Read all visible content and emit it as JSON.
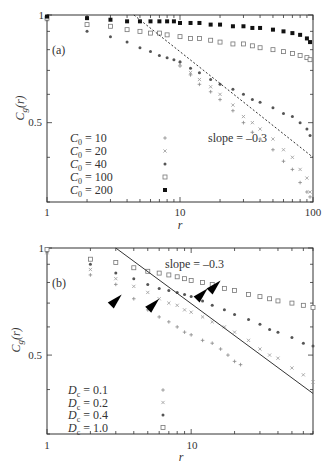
{
  "chart_data": [
    {
      "panel": "(a)",
      "type": "scatter",
      "scale": "log-log",
      "xlabel": "r",
      "ylabel": "C_g(r)",
      "xlim": [
        1,
        100
      ],
      "ylim": [
        0.3,
        1
      ],
      "xticks": [
        "1",
        "10",
        "100"
      ],
      "yticks": [
        "0.5",
        "1"
      ],
      "annotation": "slope = -0.3",
      "reference_line": {
        "slope": -0.3,
        "points": [
          [
            4.5,
            1.0
          ],
          [
            100,
            0.4
          ]
        ]
      },
      "legend_position": "lower-left",
      "series": [
        {
          "name": "C0 = 10",
          "label_sub": "0",
          "label_val": "10",
          "marker": "+",
          "x": [
            1,
            10,
            12,
            14,
            17,
            20,
            25,
            30,
            35,
            40,
            50,
            60,
            70,
            80,
            90,
            95
          ],
          "y": [
            0.97,
            0.72,
            0.68,
            0.64,
            0.61,
            0.58,
            0.54,
            0.5,
            0.47,
            0.45,
            0.42,
            0.39,
            0.37,
            0.34,
            0.32,
            0.31
          ]
        },
        {
          "name": "C0 = 20",
          "label_sub": "0",
          "label_val": "20",
          "marker": "x",
          "x": [
            1,
            10,
            12,
            14,
            17,
            20,
            25,
            30,
            35,
            40,
            50,
            60,
            70,
            80,
            90,
            95
          ],
          "y": [
            0.97,
            0.73,
            0.69,
            0.66,
            0.63,
            0.6,
            0.56,
            0.52,
            0.5,
            0.48,
            0.45,
            0.42,
            0.4,
            0.37,
            0.35,
            0.32
          ]
        },
        {
          "name": "C0 = 40",
          "label_sub": "0",
          "label_val": "40",
          "marker": "*",
          "x": [
            1,
            2,
            3,
            4,
            5,
            6,
            7,
            8,
            9,
            10,
            12,
            14,
            17,
            20,
            25,
            30,
            35,
            40,
            50,
            60,
            70,
            80,
            90,
            95
          ],
          "y": [
            0.97,
            0.9,
            0.87,
            0.84,
            0.81,
            0.79,
            0.77,
            0.76,
            0.75,
            0.74,
            0.71,
            0.69,
            0.66,
            0.64,
            0.62,
            0.6,
            0.58,
            0.57,
            0.55,
            0.53,
            0.52,
            0.5,
            0.48,
            0.46
          ]
        },
        {
          "name": "C0 = 100",
          "label_sub": "0",
          "label_val": "100",
          "marker": "square-open",
          "x": [
            1,
            2,
            3,
            4,
            5,
            6,
            7,
            8,
            10,
            12,
            14,
            17,
            20,
            25,
            30,
            35,
            40,
            50,
            60,
            70,
            80,
            90,
            95
          ],
          "y": [
            0.98,
            0.94,
            0.93,
            0.91,
            0.9,
            0.89,
            0.89,
            0.88,
            0.87,
            0.86,
            0.86,
            0.85,
            0.84,
            0.83,
            0.83,
            0.82,
            0.81,
            0.8,
            0.79,
            0.78,
            0.77,
            0.76,
            0.75
          ]
        },
        {
          "name": "C0 = 200",
          "label_sub": "0",
          "label_val": "200",
          "marker": "square-filled",
          "x": [
            1,
            2,
            3,
            4,
            5,
            6,
            7,
            8,
            9,
            10,
            12,
            14,
            17,
            20,
            25,
            30,
            35,
            40,
            50,
            60,
            70,
            80,
            90,
            95
          ],
          "y": [
            0.99,
            0.98,
            0.97,
            0.96,
            0.96,
            0.96,
            0.96,
            0.96,
            0.96,
            0.95,
            0.95,
            0.95,
            0.94,
            0.94,
            0.93,
            0.93,
            0.92,
            0.92,
            0.91,
            0.9,
            0.89,
            0.88,
            0.86,
            0.84
          ]
        }
      ]
    },
    {
      "panel": "(b)",
      "type": "scatter",
      "scale": "log-log",
      "xlabel": "r",
      "ylabel": "C_g(r)",
      "xlim": [
        1,
        70
      ],
      "ylim": [
        0.3,
        1
      ],
      "xticks": [
        "1",
        "10"
      ],
      "yticks": [
        "0.5",
        "1"
      ],
      "annotation": "slope = -0.3",
      "reference_line": {
        "slope": -0.3,
        "points": [
          [
            3.0,
            1.0
          ],
          [
            70,
            0.39
          ]
        ]
      },
      "arrows": [
        [
          3.3,
          0.74
        ],
        [
          6.0,
          0.72
        ],
        [
          13,
          0.77
        ],
        [
          16,
          0.81
        ]
      ],
      "legend_position": "lower-left",
      "series": [
        {
          "name": "Dc = 0.1",
          "label_sub": "c",
          "label_val": "0.1",
          "marker": "+",
          "x": [
            1,
            2,
            3,
            4,
            5,
            6,
            7,
            8,
            9,
            10,
            12,
            14,
            16,
            18,
            20,
            22
          ],
          "y": [
            0.97,
            0.84,
            0.79,
            0.72,
            0.67,
            0.64,
            0.62,
            0.6,
            0.58,
            0.57,
            0.55,
            0.54,
            0.52,
            0.5,
            0.48,
            0.47
          ]
        },
        {
          "name": "Dc = 0.2",
          "label_sub": "c",
          "label_val": "0.2",
          "marker": "x",
          "x": [
            1,
            2,
            3,
            4,
            5,
            6,
            7,
            8,
            9,
            10,
            12,
            14,
            17,
            20,
            25,
            30,
            35,
            40,
            50,
            60,
            70
          ],
          "y": [
            0.97,
            0.87,
            0.82,
            0.78,
            0.75,
            0.72,
            0.7,
            0.69,
            0.67,
            0.66,
            0.64,
            0.62,
            0.6,
            0.58,
            0.55,
            0.52,
            0.5,
            0.49,
            0.46,
            0.44,
            0.42
          ]
        },
        {
          "name": "Dc = 0.4",
          "label_sub": "c",
          "label_val": "0.4",
          "marker": "*",
          "x": [
            1,
            2,
            3,
            4,
            5,
            6,
            7,
            8,
            9,
            10,
            12,
            14,
            17,
            20,
            25,
            30,
            35,
            40,
            50,
            60,
            70
          ],
          "y": [
            0.98,
            0.9,
            0.85,
            0.82,
            0.79,
            0.77,
            0.76,
            0.75,
            0.74,
            0.73,
            0.71,
            0.69,
            0.67,
            0.65,
            0.63,
            0.61,
            0.59,
            0.58,
            0.56,
            0.54,
            0.53
          ]
        },
        {
          "name": "Dc = 1.0",
          "label_sub": "c",
          "label_val": "1.0",
          "marker": "square-open",
          "x": [
            1,
            2,
            3,
            4,
            5,
            6,
            7,
            8,
            9,
            10,
            12,
            14,
            17,
            20,
            25,
            30,
            35,
            40,
            50,
            60,
            70
          ],
          "y": [
            0.99,
            0.93,
            0.91,
            0.88,
            0.86,
            0.85,
            0.84,
            0.83,
            0.82,
            0.81,
            0.8,
            0.79,
            0.77,
            0.76,
            0.74,
            0.73,
            0.72,
            0.71,
            0.7,
            0.69,
            0.68
          ]
        }
      ]
    }
  ],
  "labels": {
    "a_tag": "(a)",
    "b_tag": "(b)",
    "slope": "slope = –0.3",
    "x_axis": "r",
    "y_axis_main": "C",
    "y_axis_sub": "g",
    "y_axis_arg": "(r)",
    "a_ticks": {
      "x1": "1",
      "x10": "10",
      "x100": "100",
      "y05": "0.5",
      "y1": "1"
    },
    "b_ticks": {
      "x1": "1",
      "x10": "10",
      "y05": "0.5",
      "y1": "1"
    }
  },
  "legend_a": [
    {
      "var": "C",
      "sub": "0",
      "eq": "= 10",
      "marker": "+"
    },
    {
      "var": "C",
      "sub": "0",
      "eq": "= 20",
      "marker": "x"
    },
    {
      "var": "C",
      "sub": "0",
      "eq": "= 40",
      "marker": "*"
    },
    {
      "var": "C",
      "sub": "0",
      "eq": "= 100",
      "marker": "square-open"
    },
    {
      "var": "C",
      "sub": "0",
      "eq": "= 200",
      "marker": "square-filled"
    }
  ],
  "legend_b": [
    {
      "var": "D",
      "sub": "c",
      "eq": "= 0.1",
      "marker": "+"
    },
    {
      "var": "D",
      "sub": "c",
      "eq": "= 0.2",
      "marker": "x"
    },
    {
      "var": "D",
      "sub": "c",
      "eq": "= 0.4",
      "marker": "*"
    },
    {
      "var": "D",
      "sub": "c",
      "eq": "= 1.0",
      "marker": "square-open"
    }
  ]
}
